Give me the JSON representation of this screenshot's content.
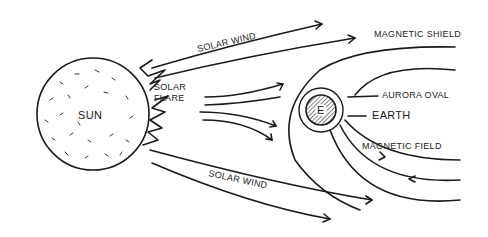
{
  "labels": {
    "sun": "SUN",
    "solar_flare_1": "SOLAR",
    "solar_flare_2": "FLARE",
    "solar_wind_top": "SOLAR WIND",
    "solar_wind_bottom": "SOLAR WIND",
    "magnetic_shield": "MAGNETIC SHIELD",
    "aurora_oval": "AURORA OVAL",
    "earth": "EARTH",
    "earth_letter": "E",
    "magnetic_field": "MAGNETIC FIELD"
  },
  "colors": {
    "ink": "#1a1a1a",
    "background": "#ffffff"
  }
}
